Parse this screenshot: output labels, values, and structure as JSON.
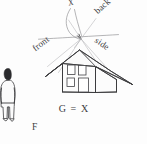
{
  "figure": {
    "caption": "G = X",
    "background_color": "#fdfdfd",
    "ink_color": "#3a3a3c",
    "construction_line_color": "#8c8c90"
  },
  "labels": {
    "vanishing_point": "X",
    "front": "front",
    "side": "side",
    "back": "back",
    "figure_person": "F"
  },
  "annotations": [
    {
      "name": "vanishing-point-label",
      "text": "X",
      "rotation_deg": -16
    },
    {
      "name": "front-plane-label",
      "text": "front",
      "rotation_deg": -37
    },
    {
      "name": "side-plane-label",
      "text": "side",
      "rotation_deg": 34
    },
    {
      "name": "back-plane-label",
      "text": "back",
      "rotation_deg": -42
    },
    {
      "name": "caption-label",
      "text": "G = X",
      "rotation_deg": 0
    },
    {
      "name": "person-label",
      "text": "F",
      "rotation_deg": 0
    }
  ],
  "house": {
    "openings": [
      {
        "name": "upper-left-window"
      },
      {
        "name": "upper-right-window"
      },
      {
        "name": "lower-left-window"
      },
      {
        "name": "front-door"
      }
    ],
    "faces": [
      "front-gable-face",
      "side-wall-face",
      "roof-slope-face",
      "roof-front-face"
    ]
  },
  "person": {
    "name": "standing-person-figure",
    "label": "F"
  }
}
